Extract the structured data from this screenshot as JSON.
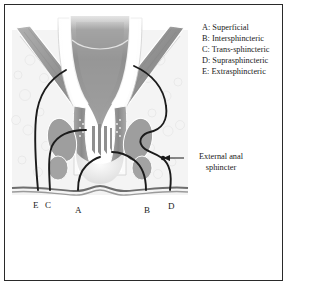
{
  "figure": {
    "frame_color": "#2a2a2a",
    "background": "#ffffff"
  },
  "legend": {
    "items": [
      {
        "key": "A",
        "text": "A: Superficial"
      },
      {
        "key": "B",
        "text": "B: Intersphincteric"
      },
      {
        "key": "C",
        "text": "C: Trans-sphincteric"
      },
      {
        "key": "D",
        "text": "D: Suprasphincteric"
      },
      {
        "key": "E",
        "text": "E: Extrasphincteric"
      }
    ]
  },
  "callout": {
    "line1": "External anal",
    "line2": "sphincter"
  },
  "markers": [
    {
      "label": "E",
      "x": 33,
      "y": 206
    },
    {
      "label": "C",
      "x": 45,
      "y": 206
    },
    {
      "label": "A",
      "x": 75,
      "y": 211
    },
    {
      "label": "B",
      "x": 144,
      "y": 211
    },
    {
      "label": "D",
      "x": 168,
      "y": 207
    }
  ],
  "anatomy": {
    "tract_color": "#1b1b1b",
    "muscle_fill": "#9a9a9a",
    "lumen_fill": "#8c8c8c",
    "mucosa_fill": "#e8e8e8",
    "fat_fill": "#f2f2f2",
    "skin_line": "#6e6e6e",
    "parts": [
      "rectal-lumen",
      "rectal-wall",
      "levator-ani-left",
      "levator-ani-right",
      "internal-anal-sphincter",
      "external-anal-sphincter",
      "anal-columns",
      "ischiorectal-fat",
      "perianal-skin"
    ]
  }
}
